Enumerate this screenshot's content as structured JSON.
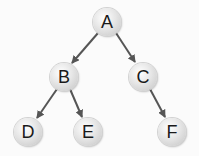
{
  "diagram": {
    "type": "binary-tree",
    "colors": {
      "edge": "#555555",
      "node_fill": "#e6e6e6",
      "label": "#1a1a1a",
      "background": "#fbfbfb"
    },
    "nodes": [
      {
        "id": "A",
        "label": "A",
        "x": 107,
        "y": 22
      },
      {
        "id": "B",
        "label": "B",
        "x": 64,
        "y": 77
      },
      {
        "id": "C",
        "label": "C",
        "x": 143,
        "y": 77
      },
      {
        "id": "D",
        "label": "D",
        "x": 28,
        "y": 132
      },
      {
        "id": "E",
        "label": "E",
        "x": 88,
        "y": 132
      },
      {
        "id": "F",
        "label": "F",
        "x": 172,
        "y": 132
      }
    ],
    "edges": [
      {
        "from": "A",
        "to": "B"
      },
      {
        "from": "A",
        "to": "C"
      },
      {
        "from": "B",
        "to": "D"
      },
      {
        "from": "B",
        "to": "E"
      },
      {
        "from": "C",
        "to": "F"
      }
    ]
  }
}
